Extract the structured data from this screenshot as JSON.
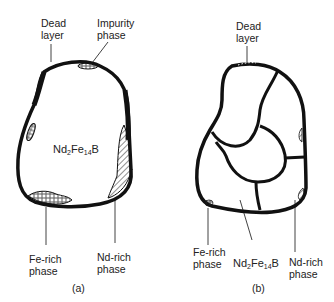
{
  "panels": [
    {
      "id": "a",
      "caption": "(a)",
      "labels": {
        "dead_layer_1": "Dead",
        "dead_layer_2": "layer",
        "impurity_1": "Impurity",
        "impurity_2": "phase",
        "fe_rich_1": "Fe-rich",
        "fe_rich_2": "phase",
        "nd_rich_1": "Nd-rich",
        "nd_rich_2": "phase"
      },
      "compound": {
        "main": "Nd",
        "s1": "2",
        "mid": "Fe",
        "s2": "14",
        "end": "B"
      }
    },
    {
      "id": "b",
      "caption": "(b)",
      "labels": {
        "dead_layer_1": "Dead",
        "dead_layer_2": "layer",
        "fe_rich_1": "Fe-rich",
        "fe_rich_2": "phase",
        "nd_rich_1": "Nd-rich",
        "nd_rich_2": "phase"
      },
      "compound": {
        "main": "Nd",
        "s1": "2",
        "mid": "Fe",
        "s2": "14",
        "end": "B"
      }
    }
  ],
  "colors": {
    "ink": "#111111",
    "background": "#ffffff"
  }
}
